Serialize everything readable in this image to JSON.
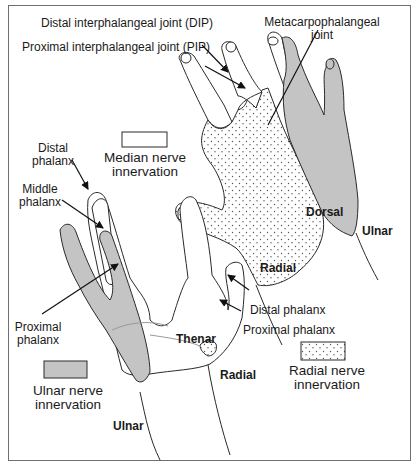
{
  "diagram": {
    "colors": {
      "border": "#6f6f6f",
      "outline": "#2a2a2a",
      "ulnar_fill": "#c4c4c4",
      "radial_fill": "#ffffff",
      "median_fill": "#ffffff",
      "dots": "#555555"
    },
    "labels": {
      "dip": "Distal interphalangeal joint (DIP)",
      "pip": "Proximal interphalangeal joint (PIP)",
      "mcp_line1": "Metacarpophalangeal",
      "mcp_line2": "joint",
      "distal_phalanx_line1": "Distal",
      "distal_phalanx_line2": "phalanx",
      "middle_phalanx_line1": "Middle",
      "middle_phalanx_line2": "phalanx",
      "proximal_phalanx_line1": "Proximal",
      "proximal_phalanx_line2": "phalanx",
      "thumb_distal_phalanx": "Distal phalanx",
      "thumb_proximal_phalanx": "Proximal phalanx",
      "thenar": "Thenar",
      "radial_palm": "Radial",
      "ulnar_palm": "Ulnar",
      "dorsal": "Dorsal",
      "radial_dorsal": "Radial",
      "ulnar_dorsal": "Ulnar"
    },
    "legend": [
      {
        "key": "median",
        "pattern": "blank",
        "line1": "Median nerve",
        "line2": "innervation"
      },
      {
        "key": "ulnar",
        "pattern": "gray",
        "line1": "Ulnar nerve",
        "line2": "innervation"
      },
      {
        "key": "radial",
        "pattern": "dotted",
        "line1": "Radial nerve",
        "line2": "innervation"
      }
    ]
  }
}
